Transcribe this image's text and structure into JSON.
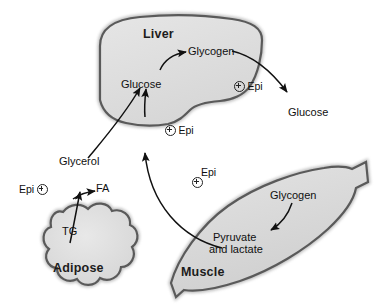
{
  "diagram": {
    "background_color": "#ffffff",
    "organ_fill_color": "#dedede",
    "organ_border_color": "#4a4a4a",
    "text_color": "#101010"
  },
  "organs": [
    {
      "id": "liver",
      "label": "Liver"
    },
    {
      "id": "adipose",
      "label": "Adipose"
    },
    {
      "id": "muscle",
      "label": "Muscle"
    }
  ],
  "metabolites": [
    {
      "id": "liver-glycogen",
      "label": "Glycogen"
    },
    {
      "id": "liver-glucose",
      "label": "Glucose"
    },
    {
      "id": "blood-glucose",
      "label": "Glucose"
    },
    {
      "id": "glycerol",
      "label": "Glycerol"
    },
    {
      "id": "fa",
      "label": "FA"
    },
    {
      "id": "tg",
      "label": "TG"
    },
    {
      "id": "muscle-glycogen",
      "label": "Glycogen"
    },
    {
      "id": "pyruvate-line1",
      "label": "Pyruvate"
    },
    {
      "id": "pyruvate-line2",
      "label": "and lactate"
    }
  ],
  "regulators": [
    {
      "id": "epi-liver-glycogenolysis",
      "label": "Epi",
      "sign": "+",
      "layout": "plus-left"
    },
    {
      "id": "epi-liver-gluconeogenesis",
      "label": "Epi",
      "sign": "+",
      "layout": "plus-left"
    },
    {
      "id": "epi-muscle",
      "label": "Epi",
      "sign": "+",
      "layout": "stacked"
    },
    {
      "id": "epi-adipose-lipolysis",
      "label": "Epi",
      "sign": "+",
      "layout": "plus-right"
    }
  ],
  "icons": {
    "plus_circle": "circled-plus-icon"
  }
}
